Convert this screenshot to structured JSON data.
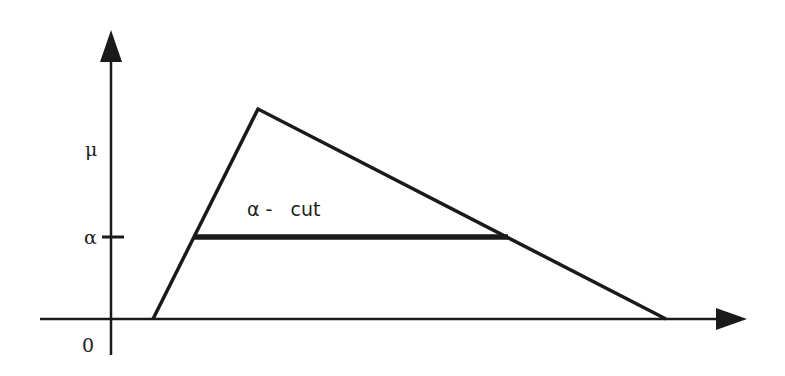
{
  "diagram": {
    "title": "",
    "type": "triangular fuzzy number with alpha-cut",
    "labels": {
      "y_axis_top": "μ",
      "alpha_level": "α",
      "origin": "0",
      "cut_label": "α -   cut"
    },
    "colors": {
      "stroke": "#1a1a1a",
      "text": "#222222",
      "background": "#ffffff"
    },
    "geometry": {
      "y_axis": {
        "x": 111,
        "y_bottom": 355,
        "y_tip": 30
      },
      "x_axis": {
        "y": 319,
        "x_left": 40,
        "x_tip": 747
      },
      "triangle": {
        "left_base": [
          153,
          319
        ],
        "peak": [
          258,
          109
        ],
        "right_base": [
          666,
          319
        ]
      },
      "alpha_cut": {
        "y": 237,
        "x_start": 193,
        "x_end": 508
      },
      "alpha_tick": {
        "x1": 102,
        "x2": 124,
        "y": 237
      }
    }
  }
}
